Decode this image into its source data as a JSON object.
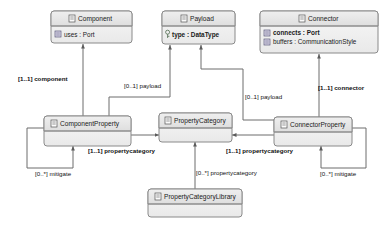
{
  "diagram": {
    "type": "uml-class-diagram",
    "background_color": "#ffffff",
    "box_header_color": "#e8e8e8",
    "box_body_color": "#f2f2f2",
    "box_border_color": "#8a8a8a",
    "line_color": "#6d6d6d",
    "text_color": "#1a1a1a"
  },
  "classes": {
    "component": {
      "name": "Component",
      "attributes": [
        {
          "text": "uses : Port",
          "bold": false,
          "icon": "attribute-icon"
        }
      ]
    },
    "payload": {
      "name": "Payload",
      "attributes": [
        {
          "text": "type : DataType",
          "bold": true,
          "icon": "key-attribute-icon"
        }
      ]
    },
    "connector": {
      "name": "Connector",
      "attributes": [
        {
          "text": "connects : Port",
          "bold": true,
          "icon": "attribute-icon"
        },
        {
          "text": "buffers : CommunicationStyle",
          "bold": false,
          "icon": "attribute-icon"
        }
      ]
    },
    "component_property": {
      "name": "ComponentProperty",
      "attributes": []
    },
    "property_category": {
      "name": "PropertyCategory",
      "attributes": []
    },
    "connector_property": {
      "name": "ConnectorProperty",
      "attributes": []
    },
    "property_category_library": {
      "name": "PropertyCategoryLibrary",
      "attributes": []
    }
  },
  "edges": [
    {
      "id": "component",
      "label": "[1..1] component",
      "bold": true,
      "from": "ComponentProperty",
      "to": "Component"
    },
    {
      "id": "payload-left",
      "label": "[0..1] payload",
      "bold": false,
      "from": "ComponentProperty",
      "to": "Payload"
    },
    {
      "id": "payload-right",
      "label": "[0..1] payload",
      "bold": false,
      "from": "ConnectorProperty",
      "to": "Payload"
    },
    {
      "id": "connector",
      "label": "[1..1] connector",
      "bold": true,
      "from": "ConnectorProperty",
      "to": "Connector"
    },
    {
      "id": "propertycategory-left",
      "label": "[1..1] propertycategory",
      "bold": true,
      "from": "ComponentProperty",
      "to": "PropertyCategory"
    },
    {
      "id": "propertycategory-right",
      "label": "[1..1] propertycategory",
      "bold": true,
      "from": "ConnectorProperty",
      "to": "PropertyCategory"
    },
    {
      "id": "propertycategory-library",
      "label": "[0..*] propertycategory",
      "bold": false,
      "from": "PropertyCategoryLibrary",
      "to": "PropertyCategory"
    },
    {
      "id": "mitigate-left",
      "label": "[0..*] mitigate",
      "bold": false,
      "from": "ComponentProperty",
      "to": "ComponentProperty"
    },
    {
      "id": "mitigate-right",
      "label": "[0..*] mitigate",
      "bold": false,
      "from": "ConnectorProperty",
      "to": "ConnectorProperty"
    }
  ]
}
